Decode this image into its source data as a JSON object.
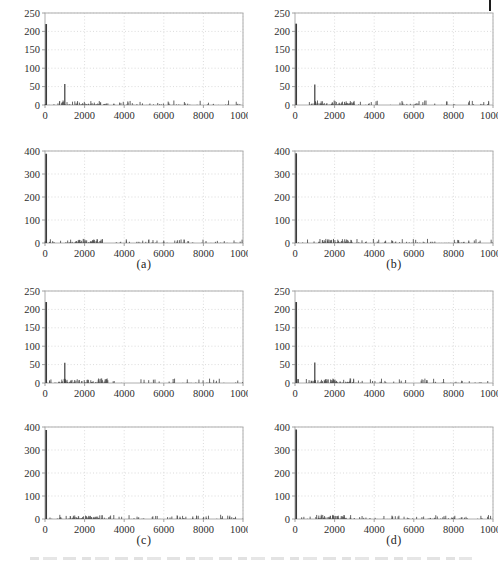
{
  "figure": {
    "panel_labels": [
      "(a)",
      "(b)",
      "(c)",
      "(d)"
    ],
    "colors": {
      "axis_box": "#aeaeae",
      "grid": "#d2d2d2",
      "tick_mark": "#8a8a8a",
      "tick_text": "#2e2e2e",
      "spike": "#3b3b3b",
      "noise": "#555555",
      "page_mark": "#1c1c1c"
    }
  },
  "chart_data": [
    {
      "id": "a-top",
      "panel": "(a)",
      "position": "top",
      "type": "line",
      "subtype": "stem-spectrum",
      "grid": true,
      "xlim": [
        0,
        10000
      ],
      "ylim": [
        0,
        250
      ],
      "xticks": [
        0,
        2000,
        4000,
        6000,
        8000,
        10000
      ],
      "yticks": [
        0,
        50,
        100,
        150,
        200,
        250
      ],
      "xticklabels": [
        "0",
        "2000",
        "4000",
        "6000",
        "8000",
        "10000"
      ],
      "yticklabels": [
        "0",
        "50",
        "100",
        "150",
        "200",
        "250"
      ],
      "spikes": [
        {
          "x": 60,
          "y": 220,
          "w": 1.7
        },
        {
          "x": 1000,
          "y": 57,
          "w": 1.2
        }
      ],
      "noise": {
        "seed": 11,
        "count": 150,
        "max_y": 12,
        "dense_range": [
          700,
          3200
        ],
        "dense_fraction": 0.45
      }
    },
    {
      "id": "b-top",
      "panel": "(b)",
      "position": "top",
      "type": "line",
      "subtype": "stem-spectrum",
      "grid": true,
      "xlim": [
        0,
        10000
      ],
      "ylim": [
        0,
        250
      ],
      "xticks": [
        0,
        2000,
        4000,
        6000,
        8000,
        10000
      ],
      "yticks": [
        0,
        50,
        100,
        150,
        200,
        250
      ],
      "xticklabels": [
        "0",
        "2000",
        "4000",
        "6000",
        "8000",
        "10000"
      ],
      "yticklabels": [
        "0",
        "50",
        "100",
        "150",
        "200",
        "250"
      ],
      "spikes": [
        {
          "x": 60,
          "y": 221,
          "w": 1.7
        },
        {
          "x": 1000,
          "y": 56,
          "w": 1.2
        }
      ],
      "noise": {
        "seed": 23,
        "count": 150,
        "max_y": 12,
        "dense_range": [
          700,
          3000
        ],
        "dense_fraction": 0.45
      }
    },
    {
      "id": "a-bottom",
      "panel": "(a)",
      "position": "bottom",
      "type": "line",
      "subtype": "stem-spectrum",
      "grid": true,
      "xlim": [
        0,
        10000
      ],
      "ylim": [
        0,
        400
      ],
      "xticks": [
        0,
        2000,
        4000,
        6000,
        8000,
        10000
      ],
      "yticks": [
        0,
        100,
        200,
        300,
        400
      ],
      "xticklabels": [
        "0",
        "2000",
        "4000",
        "6000",
        "8000",
        "10000"
      ],
      "yticklabels": [
        "0",
        "100",
        "200",
        "300",
        "400"
      ],
      "spikes": [
        {
          "x": 60,
          "y": 388,
          "w": 1.7
        }
      ],
      "noise": {
        "seed": 37,
        "count": 160,
        "max_y": 18,
        "dense_range": [
          1200,
          2900
        ],
        "dense_fraction": 0.42
      }
    },
    {
      "id": "b-bottom",
      "panel": "(b)",
      "position": "bottom",
      "type": "line",
      "subtype": "stem-spectrum",
      "grid": true,
      "xlim": [
        0,
        10000
      ],
      "ylim": [
        0,
        400
      ],
      "xticks": [
        0,
        2000,
        4000,
        6000,
        8000,
        10000
      ],
      "yticks": [
        0,
        100,
        200,
        300,
        400
      ],
      "xticklabels": [
        "0",
        "2000",
        "4000",
        "6000",
        "8000",
        "10000"
      ],
      "yticklabels": [
        "0",
        "100",
        "200",
        "300",
        "400"
      ],
      "spikes": [
        {
          "x": 60,
          "y": 390,
          "w": 1.7
        }
      ],
      "noise": {
        "seed": 41,
        "count": 160,
        "max_y": 18,
        "dense_range": [
          1200,
          2900
        ],
        "dense_fraction": 0.42
      }
    },
    {
      "id": "c-top",
      "panel": "(c)",
      "position": "top",
      "type": "line",
      "subtype": "stem-spectrum",
      "grid": true,
      "xlim": [
        0,
        10000
      ],
      "ylim": [
        0,
        250
      ],
      "xticks": [
        0,
        2000,
        4000,
        6000,
        8000,
        10000
      ],
      "yticks": [
        0,
        50,
        100,
        150,
        200,
        250
      ],
      "xticklabels": [
        "0",
        "2000",
        "4000",
        "6000",
        "8000",
        "10000"
      ],
      "yticklabels": [
        "0",
        "50",
        "100",
        "150",
        "200",
        "250"
      ],
      "spikes": [
        {
          "x": 60,
          "y": 220,
          "w": 1.7
        },
        {
          "x": 1000,
          "y": 55,
          "w": 1.2
        }
      ],
      "noise": {
        "seed": 53,
        "count": 150,
        "max_y": 12,
        "dense_range": [
          700,
          3200
        ],
        "dense_fraction": 0.45
      }
    },
    {
      "id": "d-top",
      "panel": "(d)",
      "position": "top",
      "type": "line",
      "subtype": "stem-spectrum",
      "grid": true,
      "xlim": [
        0,
        10000
      ],
      "ylim": [
        0,
        250
      ],
      "xticks": [
        0,
        2000,
        4000,
        6000,
        8000,
        10000
      ],
      "yticks": [
        0,
        50,
        100,
        150,
        200,
        250
      ],
      "xticklabels": [
        "0",
        "2000",
        "4000",
        "6000",
        "8000",
        "10000"
      ],
      "yticklabels": [
        "0",
        "50",
        "100",
        "150",
        "200",
        "250"
      ],
      "spikes": [
        {
          "x": 60,
          "y": 220,
          "w": 1.7
        },
        {
          "x": 1000,
          "y": 56,
          "w": 1.2
        }
      ],
      "noise": {
        "seed": 67,
        "count": 150,
        "max_y": 12,
        "dense_range": [
          800,
          3000
        ],
        "dense_fraction": 0.45
      }
    },
    {
      "id": "c-bottom",
      "panel": "(c)",
      "position": "bottom",
      "type": "line",
      "subtype": "stem-spectrum",
      "grid": true,
      "xlim": [
        0,
        10000
      ],
      "ylim": [
        0,
        400
      ],
      "xticks": [
        0,
        2000,
        4000,
        6000,
        8000,
        10000
      ],
      "yticks": [
        0,
        100,
        200,
        300,
        400
      ],
      "xticklabels": [
        "0",
        "2000",
        "4000",
        "6000",
        "8000",
        "10000"
      ],
      "yticklabels": [
        "0",
        "100",
        "200",
        "300",
        "400"
      ],
      "spikes": [
        {
          "x": 60,
          "y": 387,
          "w": 1.7
        }
      ],
      "noise": {
        "seed": 71,
        "count": 160,
        "max_y": 18,
        "dense_range": [
          1200,
          2900
        ],
        "dense_fraction": 0.42
      }
    },
    {
      "id": "d-bottom",
      "panel": "(d)",
      "position": "bottom",
      "type": "line",
      "subtype": "stem-spectrum",
      "grid": true,
      "xlim": [
        0,
        10000
      ],
      "ylim": [
        0,
        400
      ],
      "xticks": [
        0,
        2000,
        4000,
        6000,
        8000,
        10000
      ],
      "yticks": [
        0,
        100,
        200,
        300,
        400
      ],
      "xticklabels": [
        "0",
        "2000",
        "4000",
        "6000",
        "8000",
        "10000"
      ],
      "yticklabels": [
        "0",
        "100",
        "200",
        "300",
        "400"
      ],
      "spikes": [
        {
          "x": 60,
          "y": 389,
          "w": 1.7
        }
      ],
      "noise": {
        "seed": 83,
        "count": 160,
        "max_y": 18,
        "dense_range": [
          1200,
          2900
        ],
        "dense_fraction": 0.42
      }
    }
  ]
}
